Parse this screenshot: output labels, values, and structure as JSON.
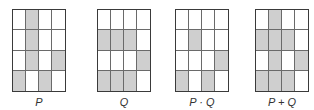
{
  "colors": {
    "shaded": "#cfcfcf",
    "border": "#3a3a3a",
    "empty": "#ffffff"
  },
  "grids": [
    {
      "label": "P",
      "x": 12,
      "cells": [
        [
          0,
          1,
          0,
          0
        ],
        [
          0,
          1,
          0,
          0
        ],
        [
          0,
          1,
          0,
          1
        ],
        [
          1,
          0,
          1,
          0
        ]
      ]
    },
    {
      "label": "Q",
      "x": 97,
      "cells": [
        [
          0,
          0,
          0,
          0
        ],
        [
          1,
          1,
          1,
          0
        ],
        [
          0,
          0,
          0,
          1
        ],
        [
          1,
          1,
          1,
          0
        ]
      ]
    },
    {
      "label": "P · Q",
      "x": 175,
      "cells": [
        [
          0,
          0,
          0,
          0
        ],
        [
          0,
          1,
          0,
          0
        ],
        [
          0,
          0,
          0,
          1
        ],
        [
          1,
          0,
          1,
          0
        ]
      ]
    },
    {
      "label": "P + Q",
      "x": 255,
      "cells": [
        [
          0,
          1,
          0,
          0
        ],
        [
          1,
          1,
          1,
          0
        ],
        [
          0,
          1,
          0,
          1
        ],
        [
          1,
          1,
          1,
          0
        ]
      ]
    }
  ]
}
